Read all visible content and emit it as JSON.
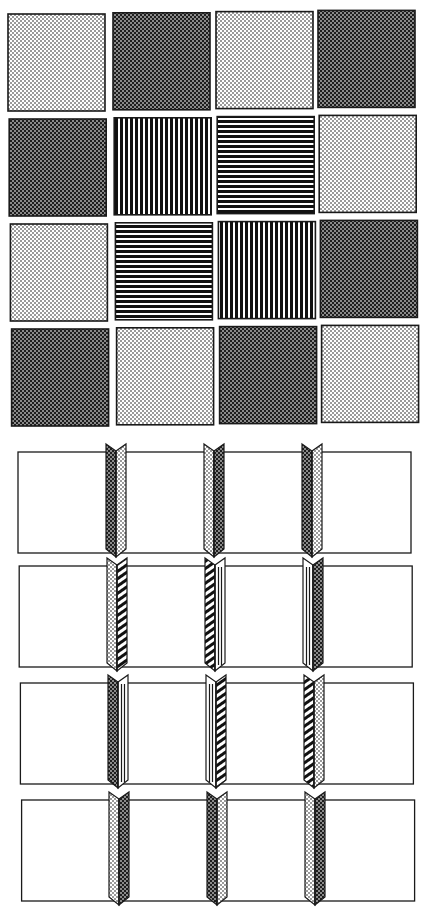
{
  "figure": {
    "patterns": {
      "light": "light dotted halftone",
      "dark": "dark checkered halftone",
      "vstripes": "vertical black stripes",
      "hstripes": "horizontal black stripes",
      "diagonal": "diagonal hatching",
      "vlines": "double vertical lines on white"
    },
    "colors": {
      "ink": "#1a1a1a",
      "paper": "#ffffff",
      "light_fill": "#d9d9d9",
      "dark_fill": "#4a4a4a"
    }
  },
  "grid": {
    "rows": [
      [
        "light",
        "dark",
        "light",
        "dark"
      ],
      [
        "dark",
        "vstripes",
        "hstripes",
        "light"
      ],
      [
        "light",
        "hstripes",
        "vstripes",
        "dark"
      ],
      [
        "dark",
        "light",
        "dark",
        "light"
      ]
    ]
  },
  "strips": [
    {
      "folds": [
        {
          "left": "dark",
          "right": "light"
        },
        {
          "left": "light",
          "right": "dark"
        },
        {
          "left": "dark",
          "right": "light"
        }
      ]
    },
    {
      "folds": [
        {
          "left": "light",
          "right": "diagonal"
        },
        {
          "left": "diagonal",
          "right": "vlines"
        },
        {
          "left": "vlines",
          "right": "dark"
        }
      ]
    },
    {
      "folds": [
        {
          "left": "dark",
          "right": "vlines"
        },
        {
          "left": "vlines",
          "right": "diagonal"
        },
        {
          "left": "diagonal",
          "right": "light"
        }
      ]
    },
    {
      "folds": [
        {
          "left": "light",
          "right": "dark"
        },
        {
          "left": "dark",
          "right": "light"
        },
        {
          "left": "light",
          "right": "dark"
        }
      ]
    }
  ]
}
